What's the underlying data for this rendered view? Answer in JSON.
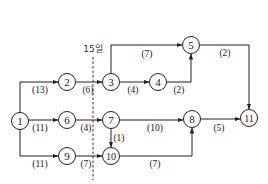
{
  "diagram": {
    "type": "activity-network",
    "cutoff_label": "15일",
    "nodes": [
      {
        "id": "1",
        "label": "1",
        "x": 20,
        "y": 121
      },
      {
        "id": "2",
        "label": "2",
        "x": 67,
        "y": 82
      },
      {
        "id": "3",
        "label": "3",
        "x": 111,
        "y": 82
      },
      {
        "id": "4",
        "label": "4",
        "x": 158,
        "y": 82
      },
      {
        "id": "5",
        "label": "5",
        "x": 191,
        "y": 45
      },
      {
        "id": "6",
        "label": "6",
        "x": 67,
        "y": 120
      },
      {
        "id": "7",
        "label": "7",
        "x": 111,
        "y": 120
      },
      {
        "id": "8",
        "label": "8",
        "x": 192,
        "y": 119
      },
      {
        "id": "9",
        "label": "9",
        "x": 67,
        "y": 156
      },
      {
        "id": "10",
        "label": "10",
        "x": 111,
        "y": 156
      },
      {
        "id": "11",
        "label": "11",
        "x": 249,
        "y": 118
      }
    ],
    "edges": [
      {
        "from": "1",
        "to": "2",
        "duration": "(13)"
      },
      {
        "from": "1",
        "to": "6",
        "duration": "(11)"
      },
      {
        "from": "1",
        "to": "9",
        "duration": "(11)"
      },
      {
        "from": "2",
        "to": "3",
        "duration": "(6)"
      },
      {
        "from": "3",
        "to": "5",
        "duration": "(7)"
      },
      {
        "from": "3",
        "to": "4",
        "duration": "(4)"
      },
      {
        "from": "4",
        "to": "5",
        "duration": "(2)"
      },
      {
        "from": "5",
        "to": "11",
        "duration": "(2)"
      },
      {
        "from": "6",
        "to": "7",
        "duration": "(4)"
      },
      {
        "from": "7",
        "to": "8",
        "duration": "(10)"
      },
      {
        "from": "7",
        "to": "10",
        "duration": "(1)"
      },
      {
        "from": "9",
        "to": "10",
        "duration": "(7)"
      },
      {
        "from": "10",
        "to": "8",
        "duration": "(7)"
      },
      {
        "from": "8",
        "to": "11",
        "duration": "(5)"
      }
    ]
  }
}
